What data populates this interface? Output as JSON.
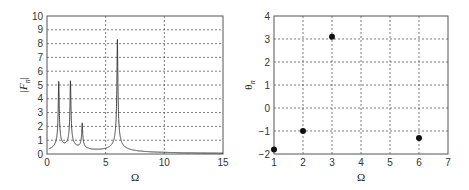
{
  "chart_data": [
    {
      "type": "line",
      "title": "",
      "xlabel": "Ω",
      "ylabel": "|F_n|",
      "xlim": [
        0,
        15
      ],
      "ylim": [
        0,
        10
      ],
      "xticks": [
        "0",
        "5",
        "10",
        "15"
      ],
      "yticks": [
        "0",
        "1",
        "2",
        "3",
        "4",
        "5",
        "6",
        "7",
        "8",
        "9",
        "10"
      ],
      "grid": true,
      "peaks": [
        {
          "x": 1,
          "y": 5.0
        },
        {
          "x": 2,
          "y": 5.0
        },
        {
          "x": 3,
          "y": 1.9
        },
        {
          "x": 6,
          "y": 8.2
        }
      ],
      "baseline_far": 0.1
    },
    {
      "type": "scatter",
      "title": "",
      "xlabel": "Ω",
      "ylabel": "θ_n",
      "xlim": [
        1,
        7
      ],
      "ylim": [
        -2,
        4
      ],
      "xticks": [
        "1",
        "2",
        "3",
        "4",
        "5",
        "6",
        "7"
      ],
      "yticks": [
        "-2",
        "-1",
        "0",
        "1",
        "2",
        "3",
        "4"
      ],
      "grid": true,
      "x": [
        1,
        2,
        3,
        6
      ],
      "y": [
        -1.8,
        -1.0,
        3.1,
        -1.3
      ]
    }
  ],
  "left": {
    "xlabel": "Ω",
    "ylabel_main": "|F",
    "ylabel_sub": "n",
    "ylabel_end": "|"
  },
  "right": {
    "xlabel": "Ω",
    "ylabel_main": "θ",
    "ylabel_sub": "n"
  }
}
